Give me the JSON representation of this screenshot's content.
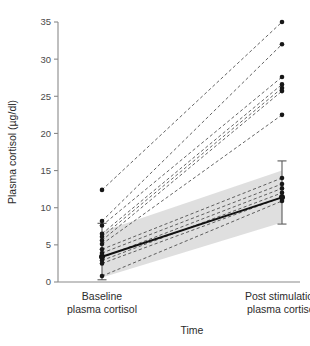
{
  "chart_data": {
    "type": "line",
    "title": "",
    "subtitle": "",
    "xlabel": "Time",
    "ylabel": "Plasma cortisol (µg/dl)",
    "ylim": [
      0,
      36
    ],
    "yticks": [
      0,
      5,
      10,
      15,
      20,
      25,
      30,
      35
    ],
    "ytick_labels": [
      "0",
      "5",
      "10",
      "15",
      "20",
      "25",
      "30",
      "35"
    ],
    "grid": false,
    "legend": "none",
    "categories": [
      "Baseline plasma cortisol",
      "Post stimulation plasma cortisol"
    ],
    "category_labels": [
      {
        "line1": "Baseline",
        "line2": "plasma cortisol"
      },
      {
        "line1": "Post stimulation",
        "line2": "plasma cortisol"
      }
    ],
    "x": [
      0,
      1
    ],
    "paired_subjects": [
      {
        "id": 1,
        "baseline": 12.4,
        "post": 35.0
      },
      {
        "id": 2,
        "baseline": 8.2,
        "post": 32.0
      },
      {
        "id": 3,
        "baseline": 7.6,
        "post": 27.6
      },
      {
        "id": 4,
        "baseline": 6.5,
        "post": 26.6
      },
      {
        "id": 5,
        "baseline": 6.1,
        "post": 26.1
      },
      {
        "id": 6,
        "baseline": 5.6,
        "post": 25.7
      },
      {
        "id": 7,
        "baseline": 5.1,
        "post": 22.5
      },
      {
        "id": 8,
        "baseline": 4.4,
        "post": 14.0
      },
      {
        "id": 9,
        "baseline": 3.9,
        "post": 13.2
      },
      {
        "id": 10,
        "baseline": 3.3,
        "post": 12.6
      },
      {
        "id": 11,
        "baseline": 2.9,
        "post": 12.0
      },
      {
        "id": 12,
        "baseline": 2.5,
        "post": 11.4
      },
      {
        "id": 13,
        "baseline": 0.8,
        "post": 10.9
      }
    ],
    "mean_line": {
      "name": "Mean",
      "values": [
        3.4,
        11.4
      ],
      "style": "solid"
    },
    "confidence_band": {
      "name": "95% CI band",
      "lower": [
        0.6,
        8.0
      ],
      "upper": [
        6.8,
        15.0
      ],
      "color": "#d9d9d9"
    },
    "error_bars": [
      {
        "x": 0,
        "mean": 3.4,
        "lower": 0.3,
        "upper": 7.9
      },
      {
        "x": 1,
        "mean": 11.4,
        "lower": 7.8,
        "upper": 16.3
      }
    ],
    "colors": {
      "point": "#171717",
      "subject_line": "#3a3a3a",
      "mean_line": "#111111",
      "band": "#d9d9d9",
      "axis": "#8a8a8a",
      "text": "#2b2b2b",
      "background": "#ffffff"
    }
  }
}
